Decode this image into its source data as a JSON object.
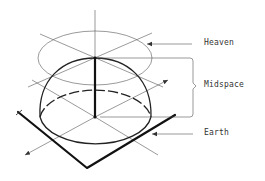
{
  "diagram": {
    "title": "",
    "labels": {
      "heaven": "Heaven",
      "midspace": "Midspace",
      "earth": "Earth"
    },
    "elements": [
      "Heaven disc (upper ellipse)",
      "Midspace dome (hemisphere) with bracket",
      "Earth square plane with axes"
    ],
    "colors": {
      "line": "#333333",
      "background": "#ffffff"
    }
  }
}
